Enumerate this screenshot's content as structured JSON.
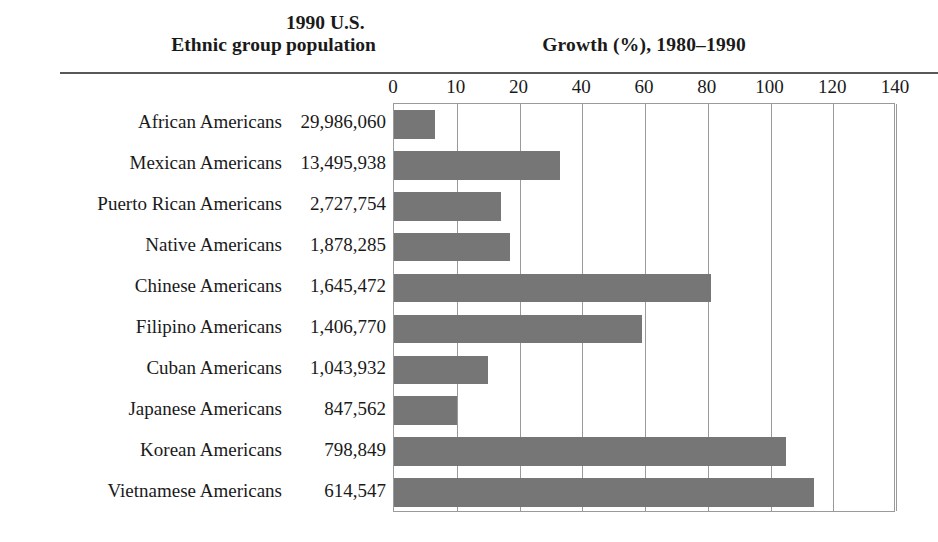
{
  "header": {
    "col_ethnic": "Ethnic group",
    "col_population_line1": "1990 U.S.",
    "col_population_line2": "population",
    "col_growth": "Growth (%), 1980–1990"
  },
  "chart_data": {
    "type": "bar",
    "orientation": "horizontal",
    "title": "Growth (%), 1980–1990",
    "xlabel": "Growth (%), 1980–1990",
    "ylabel": "Ethnic group",
    "xlim": [
      0,
      160
    ],
    "grid": true,
    "legend": "none",
    "bar_color": "#767676",
    "frame_color": "#9a9a9a",
    "tick_labels": [
      "0",
      "10",
      "20",
      "40",
      "60",
      "80",
      "100",
      "120",
      "140"
    ],
    "tick_values": [
      0,
      20,
      40,
      60,
      80,
      100,
      120,
      140,
      160
    ],
    "categories": [
      "African Americans",
      "Mexican Americans",
      "Puerto Rican Americans",
      "Native Americans",
      "Chinese Americans",
      "Filipino Americans",
      "Cuban Americans",
      "Japanese Americans",
      "Korean Americans",
      "Vietnamese Americans"
    ],
    "values": [
      13,
      53,
      34,
      37,
      101,
      79,
      30,
      20,
      125,
      134
    ],
    "populations": [
      "29,986,060",
      "13,495,938",
      "2,727,754",
      "1,878,285",
      "1,645,472",
      "1,406,770",
      "1,043,932",
      "847,562",
      "798,849",
      "614,547"
    ],
    "series": [
      {
        "name": "Growth (%), 1980–1990",
        "values": [
          13,
          53,
          34,
          37,
          101,
          79,
          30,
          20,
          125,
          134
        ]
      }
    ]
  }
}
